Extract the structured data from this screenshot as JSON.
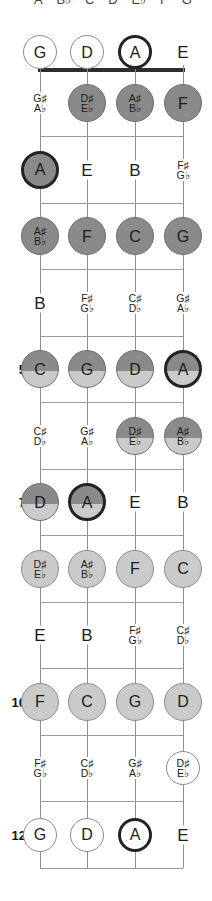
{
  "scale_header": {
    "text_notes": [
      "A",
      "B♭",
      "C",
      "D",
      "E♭",
      "F",
      "G"
    ]
  },
  "open_strings": [
    "G",
    "D",
    "A",
    "E"
  ],
  "colors": {
    "dark_fill": "#8a8a8a",
    "light_fill": "#cacaca",
    "outline_fill": "#ffffff",
    "circle_border": "#6d6d6d",
    "root_border": "#232323",
    "string_line": "#8f8f8f",
    "fret_line": "#9c9c9c",
    "nut": "#2e2e2e",
    "text": "#1c1c1c"
  },
  "rows": [
    {
      "fret": 0,
      "fret_label": "",
      "notes": [
        {
          "lines": [
            "G"
          ],
          "shade": "outline",
          "root": false
        },
        {
          "lines": [
            "D"
          ],
          "shade": "outline",
          "root": false
        },
        {
          "lines": [
            "A"
          ],
          "shade": "outline",
          "root": true
        },
        {
          "lines": [
            "E"
          ],
          "shade": "text",
          "root": false
        }
      ]
    },
    {
      "fret": 1,
      "fret_label": "",
      "notes": [
        {
          "lines": [
            "G♯",
            "A♭"
          ],
          "shade": "text",
          "root": false
        },
        {
          "lines": [
            "D♯",
            "E♭"
          ],
          "shade": "dark",
          "root": false
        },
        {
          "lines": [
            "A♯",
            "B♭"
          ],
          "shade": "dark",
          "root": false
        },
        {
          "lines": [
            "F"
          ],
          "shade": "dark",
          "root": false
        }
      ]
    },
    {
      "fret": 2,
      "fret_label": "",
      "notes": [
        {
          "lines": [
            "A"
          ],
          "shade": "dark",
          "root": true
        },
        {
          "lines": [
            "E"
          ],
          "shade": "text",
          "root": false
        },
        {
          "lines": [
            "B"
          ],
          "shade": "text",
          "root": false
        },
        {
          "lines": [
            "F♯",
            "G♭"
          ],
          "shade": "text",
          "root": false
        }
      ]
    },
    {
      "fret": 3,
      "fret_label": "",
      "notes": [
        {
          "lines": [
            "A♯",
            "B♭"
          ],
          "shade": "dark",
          "root": false
        },
        {
          "lines": [
            "F"
          ],
          "shade": "dark",
          "root": false
        },
        {
          "lines": [
            "C"
          ],
          "shade": "dark",
          "root": false
        },
        {
          "lines": [
            "G"
          ],
          "shade": "dark",
          "root": false
        }
      ]
    },
    {
      "fret": 4,
      "fret_label": "",
      "notes": [
        {
          "lines": [
            "B"
          ],
          "shade": "text",
          "root": false
        },
        {
          "lines": [
            "F♯",
            "G♭"
          ],
          "shade": "text",
          "root": false
        },
        {
          "lines": [
            "C♯",
            "D♭"
          ],
          "shade": "text",
          "root": false
        },
        {
          "lines": [
            "G♯",
            "A♭"
          ],
          "shade": "text",
          "root": false
        }
      ]
    },
    {
      "fret": 5,
      "fret_label": "5",
      "notes": [
        {
          "lines": [
            "C"
          ],
          "shade": "half",
          "root": false
        },
        {
          "lines": [
            "G"
          ],
          "shade": "half",
          "root": false
        },
        {
          "lines": [
            "D"
          ],
          "shade": "half",
          "root": false
        },
        {
          "lines": [
            "A"
          ],
          "shade": "half",
          "root": true
        }
      ]
    },
    {
      "fret": 6,
      "fret_label": "",
      "notes": [
        {
          "lines": [
            "C♯",
            "D♭"
          ],
          "shade": "text",
          "root": false
        },
        {
          "lines": [
            "G♯",
            "A♭"
          ],
          "shade": "text",
          "root": false
        },
        {
          "lines": [
            "D♯",
            "E♭"
          ],
          "shade": "half",
          "root": false
        },
        {
          "lines": [
            "A♯",
            "B♭"
          ],
          "shade": "half",
          "root": false
        }
      ]
    },
    {
      "fret": 7,
      "fret_label": "7",
      "notes": [
        {
          "lines": [
            "D"
          ],
          "shade": "half",
          "root": false
        },
        {
          "lines": [
            "A"
          ],
          "shade": "half",
          "root": true
        },
        {
          "lines": [
            "E"
          ],
          "shade": "text",
          "root": false
        },
        {
          "lines": [
            "B"
          ],
          "shade": "text",
          "root": false
        }
      ]
    },
    {
      "fret": 8,
      "fret_label": "",
      "notes": [
        {
          "lines": [
            "D♯",
            "E♭"
          ],
          "shade": "light",
          "root": false
        },
        {
          "lines": [
            "A♯",
            "B♭"
          ],
          "shade": "light",
          "root": false
        },
        {
          "lines": [
            "F"
          ],
          "shade": "light",
          "root": false
        },
        {
          "lines": [
            "C"
          ],
          "shade": "light",
          "root": false
        }
      ]
    },
    {
      "fret": 9,
      "fret_label": "",
      "notes": [
        {
          "lines": [
            "E"
          ],
          "shade": "text",
          "root": false
        },
        {
          "lines": [
            "B"
          ],
          "shade": "text",
          "root": false
        },
        {
          "lines": [
            "F♯",
            "G♭"
          ],
          "shade": "text",
          "root": false
        },
        {
          "lines": [
            "C♯",
            "D♭"
          ],
          "shade": "text",
          "root": false
        }
      ]
    },
    {
      "fret": 10,
      "fret_label": "10",
      "notes": [
        {
          "lines": [
            "F"
          ],
          "shade": "light",
          "root": false
        },
        {
          "lines": [
            "C"
          ],
          "shade": "light",
          "root": false
        },
        {
          "lines": [
            "G"
          ],
          "shade": "light",
          "root": false
        },
        {
          "lines": [
            "D"
          ],
          "shade": "light",
          "root": false
        }
      ]
    },
    {
      "fret": 11,
      "fret_label": "",
      "notes": [
        {
          "lines": [
            "F♯",
            "G♭"
          ],
          "shade": "text",
          "root": false
        },
        {
          "lines": [
            "C♯",
            "D♭"
          ],
          "shade": "text",
          "root": false
        },
        {
          "lines": [
            "G♯",
            "A♭"
          ],
          "shade": "text",
          "root": false
        },
        {
          "lines": [
            "D♯",
            "E♭"
          ],
          "shade": "outline",
          "root": false
        }
      ]
    },
    {
      "fret": 12,
      "fret_label": "12",
      "notes": [
        {
          "lines": [
            "G"
          ],
          "shade": "outline",
          "root": false
        },
        {
          "lines": [
            "D"
          ],
          "shade": "outline",
          "root": false
        },
        {
          "lines": [
            "A"
          ],
          "shade": "outline",
          "root": true
        },
        {
          "lines": [
            "E"
          ],
          "shade": "text",
          "root": false
        }
      ]
    }
  ]
}
